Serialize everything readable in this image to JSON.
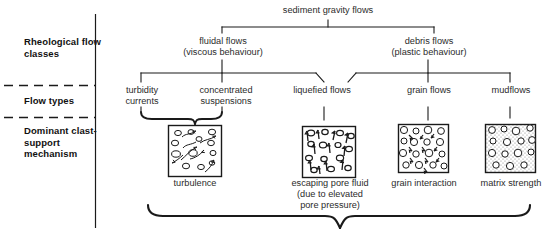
{
  "figure": {
    "root_label": "sediment gravity flows",
    "row_labels": [
      {
        "id": "rheological",
        "text": "Rheological\nflow classes"
      },
      {
        "id": "flow-types",
        "text": "Flow types"
      },
      {
        "id": "dominant",
        "text": "Dominant\nclast-support\nmechanism"
      }
    ],
    "classes": [
      {
        "id": "fluidal",
        "text": "fluidal flows\n(viscous behaviour)"
      },
      {
        "id": "debris",
        "text": "debris flows\n(plastic behaviour)"
      }
    ],
    "flow_types": [
      {
        "id": "turbidity-currents",
        "text": "turbidity\ncurrents"
      },
      {
        "id": "concentrated-suspensions",
        "text": "concentrated\nsuspensions"
      },
      {
        "id": "liquefied-flows",
        "text": "liquefied flows"
      },
      {
        "id": "grain-flows",
        "text": "grain flows"
      },
      {
        "id": "mudflows",
        "text": "mudflows"
      }
    ],
    "mechanisms": [
      {
        "id": "turbulence",
        "text": "turbulence"
      },
      {
        "id": "escaping-pore-fluid",
        "text": "escaping pore fluid\n(due to elevated\npore pressure)"
      },
      {
        "id": "grain-interaction",
        "text": "grain interaction"
      },
      {
        "id": "matrix-strength",
        "text": "matrix strength"
      }
    ],
    "colors": {
      "line": "#1a1a1a",
      "text": "#2b2b2b",
      "bold_text": "#111111",
      "box_stroke": "#1a1a1a",
      "stipple_fill": "#d8d8d8",
      "background": "#ffffff"
    }
  }
}
